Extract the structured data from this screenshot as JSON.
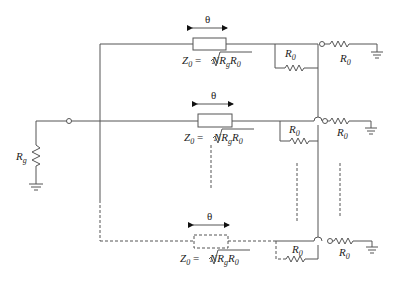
{
  "diagram": {
    "type": "N-way Wilkinson power divider schematic",
    "source": {
      "resistor_label": "R",
      "resistor_sub": "g"
    },
    "branches": [
      {
        "name": "branch-1",
        "style": "solid",
        "theta": "θ",
        "z0_prefix": "Z",
        "z0_sub": "0",
        "z0_eq": " = ",
        "z0_expr": "NR",
        "z0_expr_sub": "g",
        "z0_expr_tail": "R",
        "z0_expr_tail_sub": "0",
        "iso_resistor": "R",
        "iso_sub": "0",
        "load_resistor": "R",
        "load_sub": "0"
      },
      {
        "name": "branch-2",
        "style": "solid",
        "theta": "θ",
        "z0_prefix": "Z",
        "z0_sub": "0",
        "z0_eq": " = ",
        "z0_expr": "NR",
        "z0_expr_sub": "g",
        "z0_expr_tail": "R",
        "z0_expr_tail_sub": "0",
        "iso_resistor": "R",
        "iso_sub": "0",
        "load_resistor": "R",
        "load_sub": "0"
      },
      {
        "name": "branch-N",
        "style": "dashed",
        "theta": "θ",
        "z0_prefix": "Z",
        "z0_sub": "0",
        "z0_eq": " = ",
        "z0_expr": "NR",
        "z0_expr_sub": "g",
        "z0_expr_tail": "R",
        "z0_expr_tail_sub": "0",
        "iso_resistor": "R",
        "iso_sub": "0",
        "load_resistor": "R",
        "load_sub": "0"
      }
    ]
  }
}
